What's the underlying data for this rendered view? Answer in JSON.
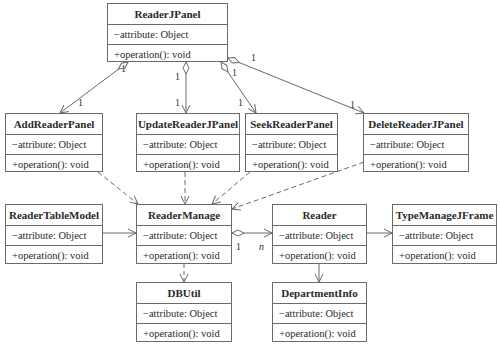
{
  "diagram": {
    "type": "UML class diagram",
    "classes": [
      {
        "id": "ReaderJPanel",
        "name": "ReaderJPanel",
        "attribute": "−attribute: Object",
        "operation": "+operation(): void",
        "box": [
          107,
          3,
          121,
          59
        ]
      },
      {
        "id": "AddReaderPanel",
        "name": "AddReaderPanel",
        "attribute": "−attribute: Object",
        "operation": "+operation(): void",
        "box": [
          5,
          113,
          98,
          59
        ]
      },
      {
        "id": "UpdateReaderJPanel",
        "name": "UpdateReaderJPanel",
        "attribute": "−attribute: Object",
        "operation": "+operation(): void",
        "box": [
          136,
          113,
          104,
          59
        ]
      },
      {
        "id": "SeekReaderPanel",
        "name": "SeekReaderPanel",
        "attribute": "−attribute: Object",
        "operation": "+operation(): void",
        "box": [
          245,
          113,
          93,
          59
        ]
      },
      {
        "id": "DeleteReaderJPanel",
        "name": "DeleteReaderJPanel",
        "attribute": "−attribute: Object",
        "operation": "+operation(): void",
        "box": [
          363,
          113,
          106,
          59
        ]
      },
      {
        "id": "ReaderTableModel",
        "name": "ReaderTableModel",
        "attribute": "−attribute: Object",
        "operation": "+operation(): void",
        "box": [
          5,
          204,
          98,
          60
        ]
      },
      {
        "id": "ReaderManage",
        "name": "ReaderManage",
        "attribute": "−attribute: Object",
        "operation": "+operation(): void",
        "box": [
          136,
          204,
          96,
          60
        ]
      },
      {
        "id": "Reader",
        "name": "Reader",
        "attribute": "−attribute: Object",
        "operation": "+operation(): void",
        "box": [
          272,
          204,
          95,
          60
        ]
      },
      {
        "id": "TypeManageJFrame",
        "name": "TypeManageJFrame",
        "attribute": "−attribute: Object",
        "operation": "+operation(): void",
        "box": [
          392,
          204,
          105,
          60
        ]
      },
      {
        "id": "DBUtil",
        "name": "DBUtil",
        "attribute": "−attribute: Object",
        "operation": "+operation(): void",
        "box": [
          136,
          282,
          96,
          60
        ]
      },
      {
        "id": "DepartmentInfo",
        "name": "DepartmentInfo",
        "attribute": "−attribute: Object",
        "operation": "+operation(): void",
        "box": [
          272,
          282,
          95,
          60
        ]
      }
    ],
    "relations": [
      {
        "from": "ReaderJPanel",
        "to": "AddReaderPanel",
        "kind": "aggregation",
        "from_mult": "1",
        "to_mult": "1"
      },
      {
        "from": "ReaderJPanel",
        "to": "UpdateReaderJPanel",
        "kind": "aggregation",
        "from_mult": "1",
        "to_mult": "1"
      },
      {
        "from": "ReaderJPanel",
        "to": "SeekReaderPanel",
        "kind": "aggregation",
        "from_mult": "1",
        "to_mult": "1"
      },
      {
        "from": "ReaderJPanel",
        "to": "DeleteReaderJPanel",
        "kind": "aggregation",
        "from_mult": "1",
        "to_mult": "1"
      },
      {
        "from": "AddReaderPanel",
        "to": "ReaderManage",
        "kind": "dependency"
      },
      {
        "from": "UpdateReaderJPanel",
        "to": "ReaderManage",
        "kind": "dependency"
      },
      {
        "from": "SeekReaderPanel",
        "to": "ReaderManage",
        "kind": "dependency"
      },
      {
        "from": "DeleteReaderJPanel",
        "to": "ReaderManage",
        "kind": "dependency"
      },
      {
        "from": "ReaderTableModel",
        "to": "ReaderManage",
        "kind": "association"
      },
      {
        "from": "ReaderManage",
        "to": "Reader",
        "kind": "aggregation",
        "from_mult": "1",
        "to_mult": "n"
      },
      {
        "from": "Reader",
        "to": "TypeManageJFrame",
        "kind": "association"
      },
      {
        "from": "Reader",
        "to": "DepartmentInfo",
        "kind": "association"
      },
      {
        "from": "ReaderManage",
        "to": "DBUtil",
        "kind": "dependency"
      }
    ],
    "multiplicity_labels": {
      "add_src": "1",
      "add_dst": "1",
      "update_src": "1",
      "update_dst": "1",
      "seek_src": "1",
      "seek_dst": "1",
      "delete_src": "1",
      "delete_dst": "1",
      "manage_reader_src": "1",
      "manage_reader_dst": "n"
    }
  },
  "colors": {
    "line": "#6a6a6a",
    "text": "#2a2a2a",
    "background": "#ffffff"
  }
}
